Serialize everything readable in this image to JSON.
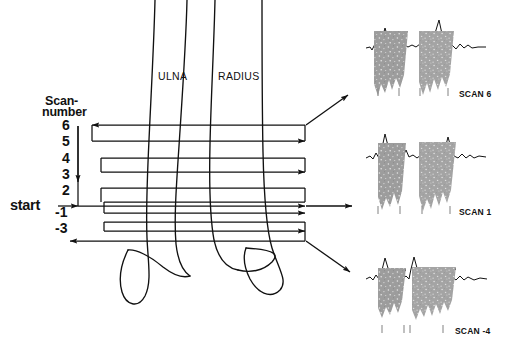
{
  "figure": {
    "title_present": false,
    "ink_color": "#111111",
    "band_color": "#9a9a9a",
    "background": "#ffffff"
  },
  "left_diagram": {
    "axis_label_line1": "Scan-",
    "axis_label_line2": "number",
    "start_label": "start",
    "scan_numbers": [
      "6",
      "5",
      "4",
      "3",
      "2",
      "-1",
      "-3"
    ],
    "bone_labels": [
      {
        "name": "ulna-label",
        "text": "ULNA"
      },
      {
        "name": "radius-label",
        "text": "RADIUS"
      }
    ]
  },
  "scan_panels": [
    {
      "id": "scan-panel-6",
      "label": "SCAN 6",
      "tick_count": 4,
      "band_count": 2,
      "position": "top"
    },
    {
      "id": "scan-panel-1",
      "label": "SCAN 1",
      "tick_count": 4,
      "band_count": 2,
      "position": "middle"
    },
    {
      "id": "scan-panel--4",
      "label": "SCAN -4",
      "tick_count": 4,
      "band_count": 2,
      "position": "bottom"
    }
  ],
  "connectors": [
    {
      "name": "connector-to-scan-6",
      "direction": "up-right"
    },
    {
      "name": "connector-to-scan-1",
      "direction": "right"
    },
    {
      "name": "connector-to-scan--4",
      "direction": "down-right"
    }
  ]
}
